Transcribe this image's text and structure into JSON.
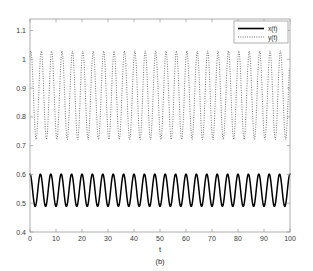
{
  "figure": {
    "caption": "(b)",
    "background_color": "#ffffff",
    "frame_color": "#9a9a9a"
  },
  "legend": {
    "position": "top-right",
    "entries": [
      {
        "label": "x(t)",
        "style": "solid",
        "color": "#000000"
      },
      {
        "label": "y(t)",
        "style": "dotted",
        "color": "#4a4a4a"
      }
    ]
  },
  "chart_data": {
    "type": "line",
    "title": "",
    "subtitle": "",
    "xlabel": "t",
    "ylabel": "",
    "caption": "(b)",
    "xlim": [
      0,
      100
    ],
    "ylim": [
      0.4,
      1.14
    ],
    "xticks": [
      0,
      10,
      20,
      30,
      40,
      50,
      60,
      70,
      80,
      90,
      100
    ],
    "xtick_labels": [
      "0",
      "10",
      "20",
      "30",
      "40",
      "50",
      "60",
      "70",
      "80",
      "90",
      "100"
    ],
    "yticks": [
      0.4,
      0.5,
      0.6,
      0.7,
      0.8,
      0.9,
      1.0,
      1.1
    ],
    "ytick_labels": [
      "0.4",
      "0.5",
      "0.6",
      "0.7",
      "0.8",
      "0.9",
      "1",
      "1.1"
    ],
    "grid": false,
    "legend_position": "upper right",
    "series": [
      {
        "name": "x(t)",
        "style": "solid",
        "color": "#000000",
        "mean": 0.545,
        "amplitude": 0.056,
        "ymin": 0.489,
        "ymax": 0.601,
        "period": 4.0,
        "cycles_shown": 25,
        "phase_deg": 90,
        "description": "Solid black sinusoid oscillating between about 0.49 and 0.60 with period 4 time units, starting near its maximum at t=0."
      },
      {
        "name": "y(t)",
        "style": "dotted",
        "color": "#4a4a4a",
        "mean": 0.875,
        "amplitude": 0.155,
        "ymin": 0.72,
        "ymax": 1.032,
        "period": 4.0,
        "cycles_shown": 25,
        "phase_deg": 60,
        "sampling_period": 0.2667,
        "beat_clusters": 14,
        "description": "Dotted sinusoid oscillating between about 0.72 and 1.03 with period 4 time units; coarse sampling creates a moire/beat pattern of roughly 14 dense vertical clusters."
      }
    ]
  }
}
